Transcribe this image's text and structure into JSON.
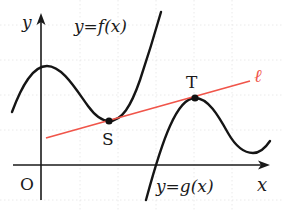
{
  "diagram": {
    "type": "function-graph",
    "axes": {
      "x_label": "x",
      "y_label": "y",
      "origin_label": "O"
    },
    "curves": [
      {
        "id": "f",
        "label": "y=f(x)"
      },
      {
        "id": "g",
        "label": "y=g(x)"
      }
    ],
    "tangent_line": {
      "label": "ℓ",
      "color": "#f0554a"
    },
    "points": [
      {
        "name": "S",
        "on": "f"
      },
      {
        "name": "T",
        "on": "g"
      }
    ],
    "colors": {
      "curve": "#151515",
      "axis": "#1a1a1a",
      "line": "#f0554a",
      "grid": "#e4e4e4"
    }
  }
}
